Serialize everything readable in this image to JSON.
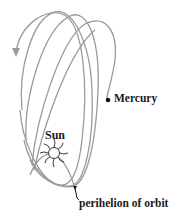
{
  "diagram": {
    "labels": {
      "sun": "Sun",
      "mercury": "Mercury",
      "perihelion": "perihelion of orbit"
    },
    "icons": {
      "sun": "sun-icon",
      "planet": "planet-dot-icon",
      "direction": "arrowhead-icon"
    },
    "orbit_count": 4,
    "colors": {
      "orbit_stroke": "#9a9a9a",
      "text": "#1a1a1a",
      "background": "#ffffff"
    }
  }
}
